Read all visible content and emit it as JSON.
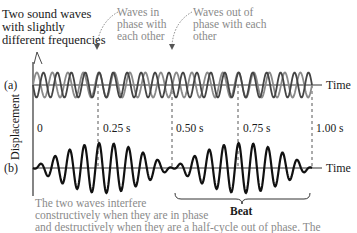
{
  "annotations": {
    "two_waves": [
      "Two sound waves",
      "with slightly",
      "different frequencies"
    ],
    "in_phase": [
      "Waves in",
      "phase with",
      "each other"
    ],
    "out_of_phase": [
      "Waves out of",
      "phase with each",
      "other"
    ]
  },
  "panels": {
    "a_label": "(a)",
    "b_label": "(b)"
  },
  "axes": {
    "y_label": "Displacement",
    "x_label_a": "Time",
    "x_label_b": "Time",
    "ticks": [
      "0",
      "0.25 s",
      "0.50 s",
      "0.75 s",
      "1.00 s"
    ]
  },
  "beat_label": "Beat",
  "caption": [
    "The two waves interfere",
    "constructively when they are in phase",
    "and destructively when they are a half-cycle out of phase. The"
  ],
  "colors": {
    "wave1": "#777777",
    "wave2": "#444444",
    "sum": "#111111",
    "axis": "#333333",
    "dashed": "#444444",
    "grey_text": "#8a8a8a"
  }
}
